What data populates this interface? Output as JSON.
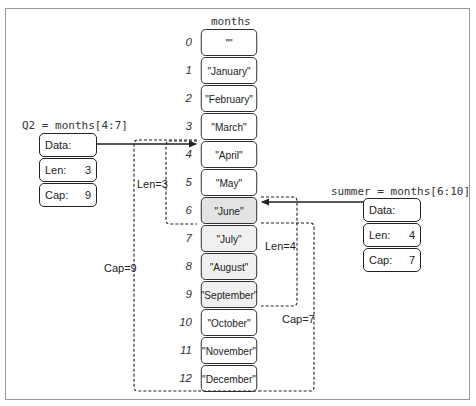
{
  "array": {
    "name": "months",
    "elements": [
      {
        "index": "0",
        "value": "\"\""
      },
      {
        "index": "1",
        "value": "\"January\""
      },
      {
        "index": "2",
        "value": "\"February\""
      },
      {
        "index": "3",
        "value": "\"March\""
      },
      {
        "index": "4",
        "value": "\"April\""
      },
      {
        "index": "5",
        "value": "\"May\""
      },
      {
        "index": "6",
        "value": "\"June\""
      },
      {
        "index": "7",
        "value": "\"July\""
      },
      {
        "index": "8",
        "value": "\"August\""
      },
      {
        "index": "9",
        "value": "\"September\""
      },
      {
        "index": "10",
        "value": "\"October\""
      },
      {
        "index": "11",
        "value": "\"November\""
      },
      {
        "index": "12",
        "value": "\"December\""
      }
    ]
  },
  "slices": {
    "q2": {
      "expression": "Q2 = months[4:7]",
      "data_label": "Data:",
      "len_label": "Len:",
      "len_value": "3",
      "cap_label": "Cap:",
      "cap_value": "9",
      "len_annotation": "Len=3",
      "cap_annotation": "Cap=9"
    },
    "summer": {
      "expression": "summer = months[6:10]",
      "data_label": "Data:",
      "len_label": "Len:",
      "len_value": "4",
      "cap_label": "Cap:",
      "cap_value": "7",
      "len_annotation": "Len=4",
      "cap_annotation": "Cap=7"
    }
  },
  "colors": {
    "shared_highlight": "#e3e3e3",
    "summer_highlight": "#f0f0f0",
    "stroke": "#222222"
  }
}
